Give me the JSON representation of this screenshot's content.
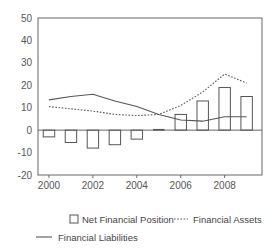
{
  "chart_data": {
    "type": "bar",
    "title": "",
    "subtitle": "",
    "xlabel": "",
    "ylabel": "",
    "x": [
      2000,
      2001,
      2002,
      2003,
      2004,
      2005,
      2006,
      2007,
      2008,
      2009
    ],
    "categories": [
      "2000",
      "2001",
      "2002",
      "2003",
      "2004",
      "2005",
      "2006",
      "2007",
      "2008",
      "2009"
    ],
    "xtick_labels": [
      "2000",
      "2002",
      "2004",
      "2006",
      "2008"
    ],
    "xtick_values": [
      2000,
      2002,
      2004,
      2006,
      2008
    ],
    "ytick_labels": [
      "50",
      "40",
      "30",
      "20",
      "10",
      "0",
      "-10",
      "-20"
    ],
    "ytick_values": [
      50,
      40,
      30,
      20,
      10,
      0,
      -10,
      -20
    ],
    "ylim": [
      -20,
      50
    ],
    "xlim": [
      1999.5,
      2009.7
    ],
    "grid": false,
    "legend_position": "bottom",
    "series": [
      {
        "name": "Net Financial Position",
        "render": "bar",
        "marker": "open-square",
        "color": "#555555",
        "fill": "none",
        "values": [
          -3,
          -5.5,
          -8,
          -6.5,
          -4,
          0,
          7,
          13,
          19,
          15
        ]
      },
      {
        "name": "Financial Assets",
        "render": "line",
        "style": "dotted",
        "color": "#555555",
        "values": [
          10.5,
          9.5,
          8.5,
          7,
          6.5,
          7,
          11,
          17,
          25,
          21
        ]
      },
      {
        "name": "Financial Liabilities",
        "render": "line",
        "style": "solid",
        "color": "#555555",
        "values": [
          13.5,
          15,
          16,
          13,
          10.5,
          7,
          4.5,
          4,
          6,
          6
        ]
      }
    ]
  },
  "legend": {
    "items": [
      {
        "label": "Net Financial Position",
        "marker": "open-square"
      },
      {
        "label": "Financial Assets",
        "marker": "dotted-line"
      },
      {
        "label": "Financial Liabilities",
        "marker": "solid-line"
      }
    ]
  }
}
